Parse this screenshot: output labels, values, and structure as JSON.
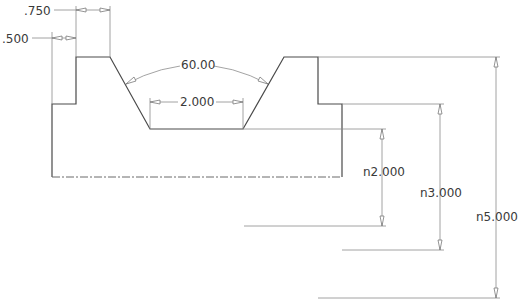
{
  "drawing": {
    "dimensions": {
      "step_width": ".750",
      "step_offset": ".500",
      "groove_angle": "60.00",
      "groove_bottom_width": "2.000",
      "height_groove_bottom": "n2.000",
      "height_shoulder": "n3.000",
      "height_overall": "n5.000"
    }
  }
}
